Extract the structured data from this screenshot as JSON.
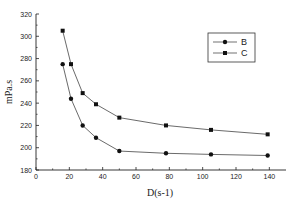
{
  "chart_data": {
    "type": "line",
    "title": "",
    "xlabel": "D(s-1)",
    "ylabel": "mPa.s",
    "xlim": [
      0,
      150
    ],
    "ylim": [
      180,
      320
    ],
    "xticks": [
      0,
      20,
      40,
      60,
      80,
      100,
      120,
      140
    ],
    "yticks": [
      180,
      200,
      220,
      240,
      260,
      280,
      300,
      320
    ],
    "grid": false,
    "legend_position": "upper right",
    "series": [
      {
        "name": "B",
        "marker": "circle",
        "x": [
          16,
          21,
          28,
          36,
          50,
          78,
          105,
          139
        ],
        "y": [
          275,
          244,
          220,
          209,
          197,
          195,
          194,
          193
        ]
      },
      {
        "name": "C",
        "marker": "square",
        "x": [
          16,
          21,
          28,
          36,
          50,
          78,
          105,
          139
        ],
        "y": [
          305,
          275,
          249,
          239,
          227,
          220,
          216,
          212
        ]
      }
    ]
  },
  "legend": {
    "items": [
      {
        "label": "B"
      },
      {
        "label": "C"
      }
    ]
  },
  "axes": {
    "x_title": "D(s-1)",
    "y_title": "mPa.s"
  }
}
